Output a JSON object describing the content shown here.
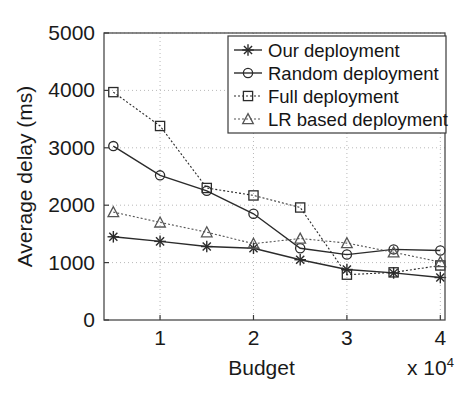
{
  "figure": {
    "background": "#ffffff",
    "foreground": "#1a1a1a",
    "grid_color": "#b9b9b9"
  },
  "axes": {
    "y_title": "Average delay (ms)",
    "x_title": "Budget",
    "x_multiplier_prefix": "x 10",
    "x_multiplier_exponent": "4",
    "y_ticks": [
      "0",
      "1000",
      "2000",
      "3000",
      "4000",
      "5000"
    ],
    "x_ticks": [
      "1",
      "2",
      "3",
      "4"
    ]
  },
  "legend": {
    "items": [
      {
        "label": "Our deployment",
        "marker": "star-marker",
        "line": "solid"
      },
      {
        "label": "Random deployment",
        "marker": "circle-marker",
        "line": "solid"
      },
      {
        "label": "Full deployment",
        "marker": "square-marker",
        "line": "dotted"
      },
      {
        "label": "LR based deployment",
        "marker": "triangle-marker",
        "line": "dotted"
      }
    ]
  },
  "chart_data": {
    "type": "line",
    "title": "",
    "xlabel": "Budget",
    "ylabel": "Average delay (ms)",
    "x_multiplier": 10000,
    "x": [
      5000,
      10000,
      15000,
      20000,
      25000,
      30000,
      35000,
      40000
    ],
    "x_display": [
      0.5,
      1,
      1.5,
      2,
      2.5,
      3,
      3.5,
      4
    ],
    "xlim": [
      4000,
      40500
    ],
    "ylim": [
      0,
      5000
    ],
    "x_tick_values": [
      10000,
      20000,
      30000,
      40000
    ],
    "y_tick_values": [
      0,
      1000,
      2000,
      3000,
      4000,
      5000
    ],
    "grid": true,
    "legend_position": "top-right",
    "series": [
      {
        "name": "Our deployment",
        "marker": "star",
        "linestyle": "solid",
        "color": "#2b2b2b",
        "values": [
          1450,
          1370,
          1280,
          1250,
          1050,
          880,
          820,
          740
        ]
      },
      {
        "name": "Random deployment",
        "marker": "circle",
        "linestyle": "solid",
        "color": "#2b2b2b",
        "values": [
          3030,
          2520,
          2250,
          1850,
          1250,
          1140,
          1230,
          1210
        ]
      },
      {
        "name": "Full deployment",
        "marker": "square",
        "linestyle": "dotted",
        "color": "#2b2b2b",
        "values": [
          3970,
          3380,
          2300,
          2170,
          1960,
          790,
          830,
          950
        ]
      },
      {
        "name": "LR based deployment",
        "marker": "triangle",
        "linestyle": "dotted",
        "color": "#555555",
        "values": [
          1880,
          1700,
          1530,
          1330,
          1420,
          1340,
          1180,
          1010
        ]
      }
    ]
  }
}
